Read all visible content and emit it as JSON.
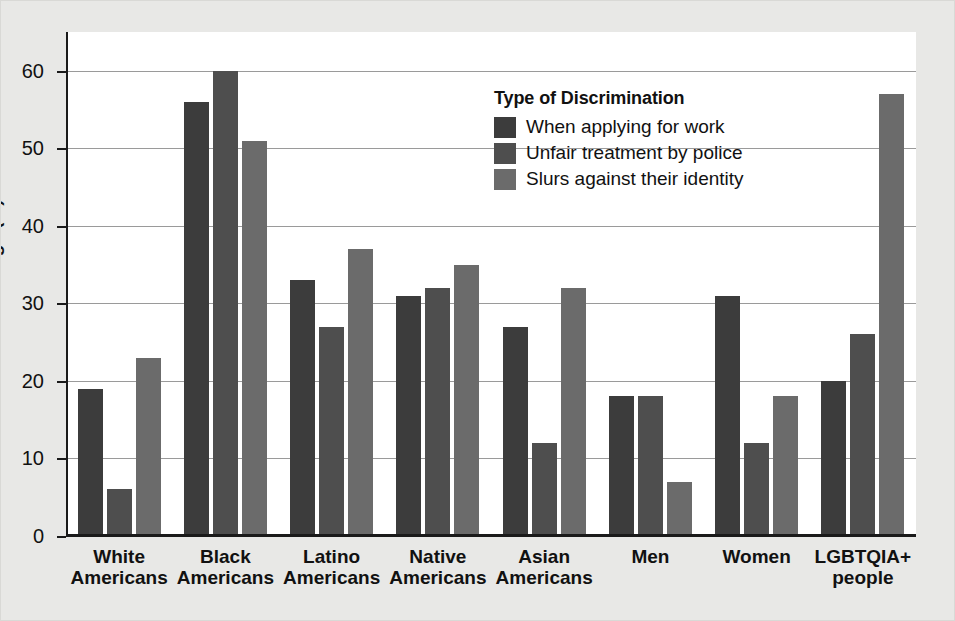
{
  "chart_data": {
    "type": "bar",
    "title": "",
    "xlabel": "",
    "ylabel": "Percentage (%)",
    "ylim": [
      0,
      65
    ],
    "yticks": [
      0,
      10,
      20,
      30,
      40,
      50,
      60
    ],
    "ytick_labels": [
      "0",
      "10",
      "20",
      "30",
      "40",
      "50",
      "60"
    ],
    "grid": "horizontal",
    "legend_position": "upper-center",
    "legend_title": "Type of Discrimination",
    "categories": [
      "White\nAmericans",
      "Black\nAmericans",
      "Latino\nAmericans",
      "Native\nAmericans",
      "Asian\nAmericans",
      "Men",
      "Women",
      "LGBTQIA+\npeople"
    ],
    "series": [
      {
        "name": "When applying for work",
        "color": "#3c3c3c",
        "values": [
          19,
          56,
          33,
          31,
          27,
          18,
          31,
          20
        ]
      },
      {
        "name": "Unfair treatment by police",
        "color": "#4e4e4e",
        "values": [
          6,
          60,
          27,
          32,
          12,
          18,
          12,
          26
        ]
      },
      {
        "name": "Slurs against their identity",
        "color": "#6b6b6b",
        "values": [
          23,
          51,
          37,
          35,
          32,
          7,
          18,
          57
        ]
      }
    ]
  },
  "colors": {
    "figure_background": "#e8e8e6",
    "plot_background": "#ffffff",
    "axis": "#1a1a1a",
    "gridline": "#9a9a9a",
    "text": "#111111"
  }
}
